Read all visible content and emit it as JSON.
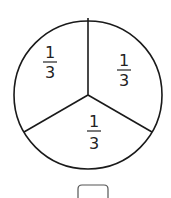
{
  "diagram": {
    "type": "fraction-circle",
    "parts": 3,
    "sections": [
      {
        "position": "top-left",
        "numerator": "1",
        "denominator": "3"
      },
      {
        "position": "top-right",
        "numerator": "1",
        "denominator": "3"
      },
      {
        "position": "bottom",
        "numerator": "1",
        "denominator": "3"
      }
    ],
    "answer_box": {
      "value": ""
    }
  }
}
